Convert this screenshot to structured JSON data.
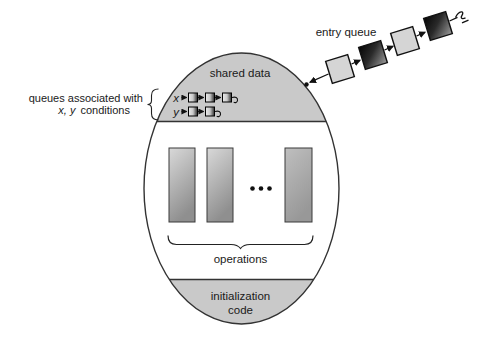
{
  "monitor": {
    "shared_data_label": "shared data",
    "operations_label": "operations",
    "init_label_line1": "initialization",
    "init_label_line2": "code",
    "operation_bar_count": 3,
    "has_ellipsis_between_bars": true
  },
  "entry_queue": {
    "label": "entry queue",
    "process_count": 4
  },
  "condition_queues": {
    "label_line1": "queues associated with",
    "label_line2_vars": "x, y",
    "label_line2_rest": "conditions",
    "queues": [
      {
        "name": "x",
        "node_count": 3
      },
      {
        "name": "y",
        "node_count": 2
      }
    ]
  },
  "colors": {
    "region_fill": "#c9c9c9",
    "outline": "#333333",
    "square_light": "#d5d5d5",
    "square_dark_start": "#050505",
    "square_dark_end": "#9c9c9c",
    "text": "#1a1a1a",
    "background": "#ffffff"
  }
}
